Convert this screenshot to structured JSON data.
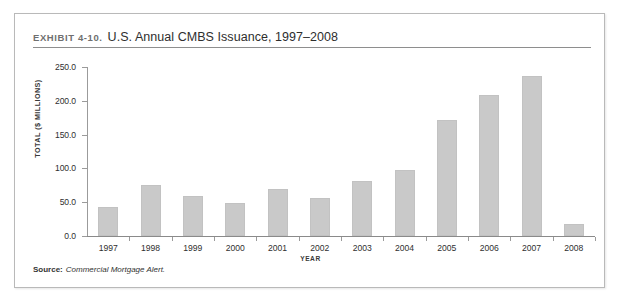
{
  "exhibit": {
    "number": "EXHIBIT 4-10.",
    "title": "U.S. Annual CMBS Issuance, 1997–2008",
    "source_label": "Source:",
    "source_text": "Commercial Mortgage Alert."
  },
  "colors": {
    "bar_fill": "#c9c9c9",
    "bar_stroke": "#c2c2c2",
    "axis": "#8a8a8a",
    "frame": "#b9b9b9",
    "text": "#2f2f2f",
    "background": "#ffffff"
  },
  "chart_data": {
    "type": "bar",
    "title": "U.S. Annual CMBS Issuance, 1997–2008",
    "xlabel": "YEAR",
    "ylabel": "TOTAL ($ MILLIONS)",
    "categories": [
      "1997",
      "1998",
      "1999",
      "2000",
      "2001",
      "2002",
      "2003",
      "2004",
      "2005",
      "2006",
      "2007",
      "2008"
    ],
    "values": [
      43.0,
      76.0,
      59.0,
      49.0,
      70.0,
      56.0,
      82.0,
      97.0,
      172.0,
      208.0,
      237.0,
      18.0
    ],
    "ylim": [
      0.0,
      250.0
    ],
    "ytick_values": [
      0.0,
      50.0,
      100.0,
      150.0,
      200.0,
      250.0
    ],
    "ytick_labels": [
      "0.0",
      "50.0",
      "100.0",
      "150.0",
      "200.0",
      "250.0"
    ],
    "grid": false,
    "legend": false,
    "legend_position": "none"
  }
}
